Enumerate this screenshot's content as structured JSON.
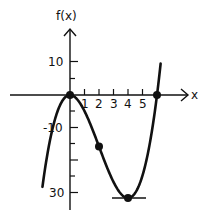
{
  "chart_data": {
    "type": "line",
    "title": "",
    "xlabel": "x",
    "ylabel": "f(x)",
    "function": "f(x) = x^3 - 6x^2",
    "x_ticks": [
      1,
      2,
      3,
      4,
      5
    ],
    "x_tick_labels": [
      "1",
      "2",
      "3",
      "4",
      "5"
    ],
    "y_tick_labels": [
      "10",
      "-10",
      "-30"
    ],
    "y_ticks": [
      10,
      -10,
      -30
    ],
    "xlim": [
      -1.9,
      6.25
    ],
    "ylim": [
      -32,
      10
    ],
    "grid": false,
    "series": [
      {
        "name": "f(x)",
        "x": [
          -1.9,
          -1.5,
          -1,
          -0.5,
          0,
          0.5,
          1,
          1.5,
          2,
          2.5,
          3,
          3.5,
          4,
          4.5,
          5,
          5.5,
          6,
          6.25
        ],
        "values": [
          -28.5,
          -16.9,
          -7,
          -1.6,
          0,
          -1.4,
          -5,
          -10.1,
          -16,
          -21.9,
          -27,
          -30.6,
          -32,
          -30.4,
          -25,
          -15.1,
          0,
          9.8
        ]
      }
    ],
    "marked_points": [
      {
        "x": 0,
        "y": 0,
        "label": "local maximum"
      },
      {
        "x": 2,
        "y": -16,
        "label": "inflection point"
      },
      {
        "x": 4,
        "y": -32,
        "label": "local minimum"
      },
      {
        "x": 6,
        "y": 0,
        "label": "root"
      }
    ],
    "annotations": [
      "horizontal tangent at x=4"
    ]
  },
  "labels": {
    "y_axis": "f(x)",
    "x_axis": "x",
    "y10": "10",
    "yneg10": "-10",
    "yneg30": "30",
    "yneg30_dash": "-",
    "x1": "1",
    "x2": "2",
    "x3": "3",
    "x4": "4",
    "x5": "5"
  }
}
